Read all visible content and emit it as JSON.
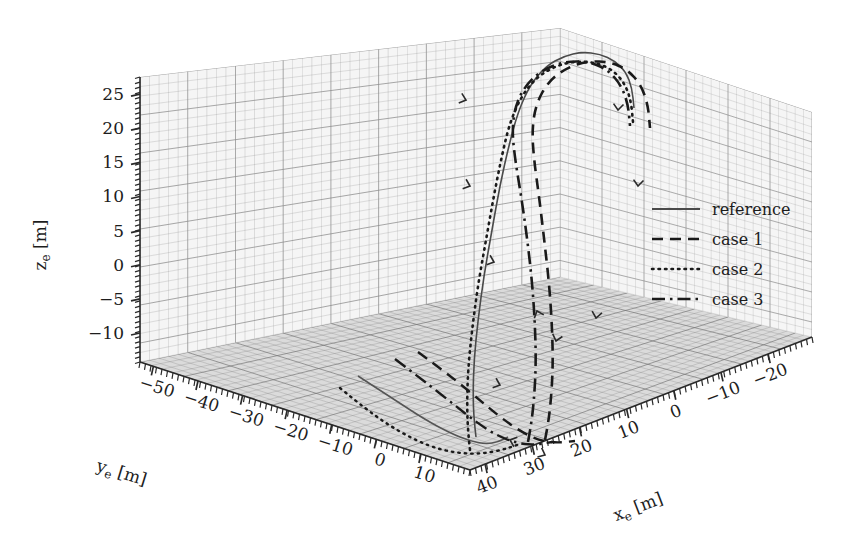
{
  "figure": {
    "type": "3d-trajectory-plot",
    "background_color": "#ffffff",
    "ink_color": "#1d1d1d",
    "grid_color": "#9a9a9a",
    "floor_fill": "#cfcfcf"
  },
  "axes": {
    "x": {
      "label_main": "x",
      "label_sub": "e",
      "label_unit": "[m]",
      "ticks": [
        "40",
        "30",
        "20",
        "10",
        "0",
        "-10",
        "-20"
      ],
      "range": [
        40,
        -20
      ]
    },
    "y": {
      "label_main": "y",
      "label_sub": "e",
      "label_unit": "[m]",
      "ticks": [
        "-50",
        "-40",
        "-30",
        "-20",
        "-10",
        "0",
        "10"
      ],
      "range": [
        -50,
        10
      ]
    },
    "z": {
      "label_main": "z",
      "label_sub": "e",
      "label_unit": "[m]",
      "ticks": [
        "25",
        "20",
        "15",
        "10",
        "5",
        "0",
        "-5",
        "-10"
      ],
      "range": [
        -10,
        28
      ]
    }
  },
  "legend": {
    "position": "right-middle",
    "entries": [
      {
        "label": "reference",
        "style": "solid",
        "color": "#4a4a4a",
        "width": 1.6
      },
      {
        "label": "case 1",
        "style": "dashed",
        "color": "#1a1a1a",
        "width": 2.6
      },
      {
        "label": "case 2",
        "style": "dotted",
        "color": "#1a1a1a",
        "width": 2.6
      },
      {
        "label": "case 3",
        "style": "dashdot",
        "color": "#1a1a1a",
        "width": 2.6
      }
    ]
  },
  "chart_data": {
    "type": "line",
    "title": "",
    "xlabel": "x_e [m]",
    "ylabel": "y_e [m]",
    "zlabel": "z_e [m]",
    "grid": true,
    "legend_position": "right",
    "projection": "3d",
    "xlim": [
      40,
      -20
    ],
    "ylim": [
      -50,
      10
    ],
    "zlim": [
      -10,
      28
    ],
    "series": [
      {
        "name": "reference",
        "style": "solid",
        "points_screen": [
          [
            476,
            437
          ],
          [
            474,
            420
          ],
          [
            473,
            395
          ],
          [
            474,
            360
          ],
          [
            478,
            320
          ],
          [
            484,
            275
          ],
          [
            492,
            230
          ],
          [
            500,
            185
          ],
          [
            509,
            145
          ],
          [
            518,
            112
          ],
          [
            530,
            85
          ],
          [
            546,
            66
          ],
          [
            564,
            56
          ],
          [
            582,
            52
          ],
          [
            600,
            54
          ],
          [
            615,
            61
          ],
          [
            626,
            72
          ],
          [
            632,
            88
          ],
          [
            634,
            108
          ]
        ]
      },
      {
        "name": "case 1",
        "style": "dashed",
        "points_screen": [
          [
            545,
            440
          ],
          [
            548,
            425
          ],
          [
            551,
            400
          ],
          [
            553,
            365
          ],
          [
            552,
            325
          ],
          [
            549,
            282
          ],
          [
            544,
            238
          ],
          [
            539,
            196
          ],
          [
            534,
            160
          ],
          [
            532,
            130
          ],
          [
            536,
            104
          ],
          [
            548,
            82
          ],
          [
            566,
            68
          ],
          [
            588,
            61
          ],
          [
            610,
            62
          ],
          [
            628,
            70
          ],
          [
            641,
            85
          ],
          [
            648,
            105
          ],
          [
            650,
            128
          ]
        ]
      },
      {
        "name": "case 2",
        "style": "dotted",
        "points_screen": [
          [
            470,
            450
          ],
          [
            468,
            432
          ],
          [
            467,
            405
          ],
          [
            468,
            370
          ],
          [
            472,
            330
          ],
          [
            478,
            285
          ],
          [
            486,
            240
          ],
          [
            494,
            195
          ],
          [
            502,
            155
          ],
          [
            510,
            122
          ],
          [
            522,
            95
          ],
          [
            538,
            76
          ],
          [
            558,
            65
          ],
          [
            578,
            61
          ],
          [
            598,
            63
          ],
          [
            614,
            71
          ],
          [
            625,
            84
          ],
          [
            631,
            101
          ],
          [
            633,
            122
          ]
        ]
      },
      {
        "name": "case 3",
        "style": "dashdot",
        "points_screen": [
          [
            528,
            442
          ],
          [
            531,
            426
          ],
          [
            534,
            400
          ],
          [
            536,
            365
          ],
          [
            535,
            324
          ],
          [
            532,
            281
          ],
          [
            527,
            237
          ],
          [
            521,
            195
          ],
          [
            515,
            159
          ],
          [
            512,
            129
          ],
          [
            516,
            103
          ],
          [
            528,
            82
          ],
          [
            546,
            68
          ],
          [
            568,
            61
          ],
          [
            590,
            62
          ],
          [
            608,
            70
          ],
          [
            621,
            85
          ],
          [
            628,
            104
          ],
          [
            630,
            126
          ]
        ]
      }
    ],
    "ground_projections": [
      {
        "name": "reference-ground",
        "style": "solid",
        "points_screen": [
          [
            358,
            376
          ],
          [
            392,
            398
          ],
          [
            424,
            419
          ],
          [
            450,
            433
          ],
          [
            470,
            441
          ],
          [
            486,
            444
          ],
          [
            498,
            442
          ],
          [
            508,
            437
          ]
        ]
      },
      {
        "name": "case1-ground",
        "style": "dashed",
        "points_screen": [
          [
            418,
            352
          ],
          [
            448,
            374
          ],
          [
            476,
            397
          ],
          [
            500,
            417
          ],
          [
            520,
            431
          ],
          [
            538,
            440
          ],
          [
            556,
            443
          ],
          [
            575,
            441
          ]
        ]
      },
      {
        "name": "case2-ground",
        "style": "dotted",
        "points_screen": [
          [
            340,
            388
          ],
          [
            368,
            411
          ],
          [
            398,
            431
          ],
          [
            428,
            446
          ],
          [
            456,
            453
          ],
          [
            480,
            454
          ],
          [
            502,
            450
          ],
          [
            520,
            444
          ]
        ]
      },
      {
        "name": "case3-ground",
        "style": "dashdot",
        "points_screen": [
          [
            395,
            359
          ],
          [
            424,
            381
          ],
          [
            452,
            403
          ],
          [
            476,
            422
          ],
          [
            496,
            435
          ],
          [
            516,
            443
          ],
          [
            534,
            445
          ],
          [
            552,
            442
          ]
        ]
      }
    ]
  }
}
